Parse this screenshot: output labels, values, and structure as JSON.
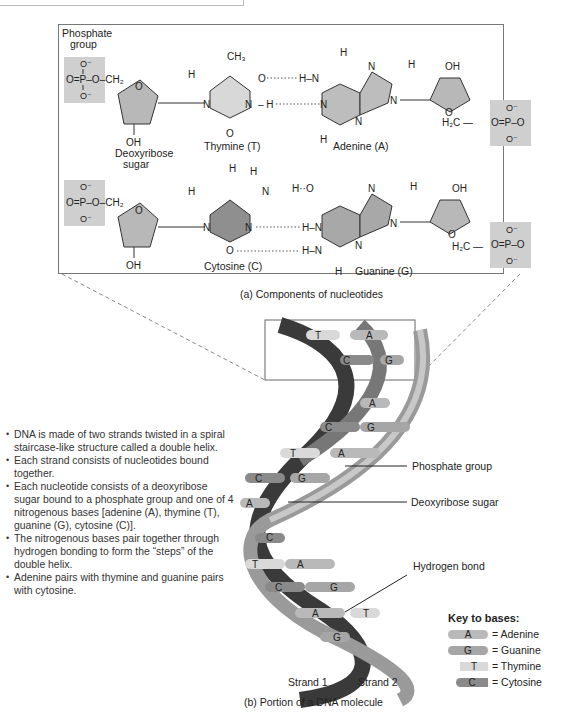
{
  "part_a": {
    "caption": "(a) Components of nucleotides",
    "phosphate_group_label": [
      "Phosphate",
      "group"
    ],
    "deoxyribose_label": [
      "Deoxyribose",
      "sugar"
    ],
    "pair1": {
      "left_base": "Thymine (T)",
      "right_base": "Adenine (A)",
      "methyl": "CH3"
    },
    "pair2": {
      "left_base": "Cytosine (C)",
      "right_base": "Guanine (G)"
    },
    "atoms": {
      "O_minus": "O⁻",
      "P": "P",
      "O": "O",
      "N": "N",
      "H": "H",
      "OH": "OH",
      "CH2": "CH₂",
      "H2C": "H₂C"
    }
  },
  "part_b": {
    "caption": "(b) Portion of a DNA molecule",
    "callouts": {
      "phosphate": "Phosphate group",
      "sugar": "Deoxyribose sugar",
      "hbond": "Hydrogen bond"
    },
    "strand_labels": [
      "Strand 1",
      "Strand 2"
    ],
    "base_pairs": [
      {
        "left": "T",
        "right": "A"
      },
      {
        "left": "C",
        "right": "G"
      },
      {
        "left": "",
        "right": "A"
      },
      {
        "left": "C",
        "right": "G"
      },
      {
        "left": "T",
        "right": "A"
      },
      {
        "left": "C",
        "right": "G"
      },
      {
        "left": "A",
        "right": ""
      },
      {
        "left": "",
        "right": "C"
      },
      {
        "left": "T",
        "right": "A"
      },
      {
        "left": "C",
        "right": "G"
      },
      {
        "left": "A",
        "right": "T"
      },
      {
        "left": "G",
        "right": ""
      }
    ]
  },
  "bullets": [
    "DNA is made of two strands twisted in a spiral staircase-like structure called a double helix.",
    "Each strand consists of nucleotides bound together.",
    "Each nucleotide consists of a deoxyribose sugar bound to a phosphate group and one of 4 nitrogenous bases [adenine (A), thymine (T), guanine (G), cytosine (C)].",
    "The nitrogenous bases pair together through hydrogen bonding to form the “steps” of the double helix.",
    "Adenine pairs with thymine and guanine pairs with cytosine."
  ],
  "key": {
    "title": "Key to bases:",
    "items": [
      {
        "letter": "A",
        "label": "= Adenine",
        "color": "#b9b9b9"
      },
      {
        "letter": "G",
        "label": "= Guanine",
        "color": "#a6a6a6"
      },
      {
        "letter": "T",
        "label": "= Thymine",
        "color": "#d9d9d9"
      },
      {
        "letter": "C",
        "label": "= Cytosine",
        "color": "#8a8a8a"
      }
    ]
  },
  "colors": {
    "phosphate_box": "#cfcfcf",
    "sugar_fill": "#b8b8b8",
    "thymine_fill": "#d8d8d8",
    "adenine_fill": "#bdbdbd",
    "cytosine_fill": "#8f8f8f",
    "guanine_fill": "#a8a8a8",
    "strand_dark": "#333333",
    "strand_light": "#c8c8c8"
  }
}
